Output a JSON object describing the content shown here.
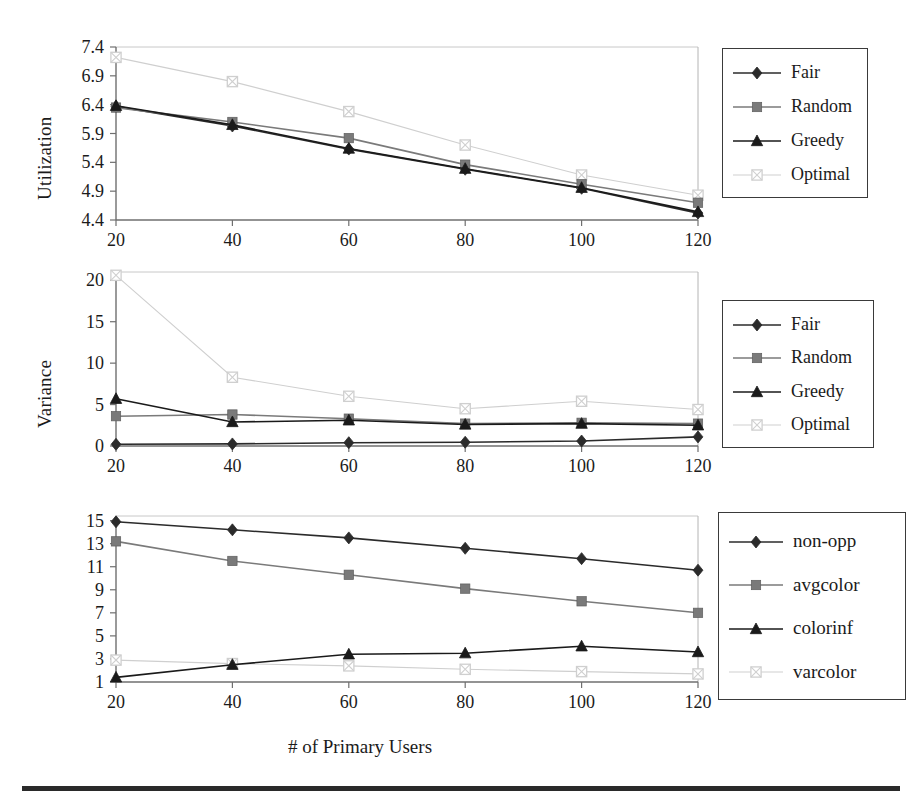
{
  "figure": {
    "xlabel": "# of Primary Users",
    "background": "#ffffff",
    "rule_color": "#2a2a2a"
  },
  "colors": {
    "fair": "#2b2b2b",
    "random": "#7a7a7a",
    "greedy": "#1a1a1a",
    "optimal": "#cfcfcf",
    "axis": "#9a9a9a",
    "text": "#1b1b1b"
  },
  "chart_data": [
    {
      "type": "line",
      "title": "",
      "xlabel": "# of Primary Users",
      "ylabel": "Utilization",
      "x": [
        20,
        40,
        60,
        80,
        100,
        120
      ],
      "xticks": [
        "20",
        "40",
        "60",
        "80",
        "100",
        "120"
      ],
      "xlim": [
        20,
        120
      ],
      "ylim": [
        4.4,
        7.4
      ],
      "yticks": [
        "4.4",
        "4.9",
        "5.4",
        "5.9",
        "6.4",
        "6.9",
        "7.4"
      ],
      "ytickvals": [
        4.4,
        4.9,
        5.4,
        5.9,
        6.4,
        6.9,
        7.4
      ],
      "grid": false,
      "legend_position": "right",
      "series": [
        {
          "name": "Fair",
          "marker": "diamond",
          "color": "#2b2b2b",
          "values": [
            6.37,
            6.03,
            5.63,
            5.28,
            4.95,
            4.52
          ]
        },
        {
          "name": "Random",
          "marker": "square",
          "color": "#7a7a7a",
          "values": [
            6.35,
            6.1,
            5.82,
            5.36,
            5.02,
            4.7
          ]
        },
        {
          "name": "Greedy",
          "marker": "triangle",
          "color": "#1a1a1a",
          "values": [
            6.38,
            6.05,
            5.64,
            5.29,
            4.96,
            4.54
          ]
        },
        {
          "name": "Optimal",
          "marker": "square-cross",
          "color": "#cfcfcf",
          "values": [
            7.22,
            6.8,
            6.28,
            5.7,
            5.18,
            4.83
          ]
        }
      ]
    },
    {
      "type": "line",
      "title": "",
      "xlabel": "# of Primary Users",
      "ylabel": "Variance",
      "x": [
        20,
        40,
        60,
        80,
        100,
        120
      ],
      "xticks": [
        "20",
        "40",
        "60",
        "80",
        "100",
        "120"
      ],
      "xlim": [
        20,
        120
      ],
      "ylim": [
        0,
        21
      ],
      "yticks": [
        "0",
        "5",
        "10",
        "15",
        "20"
      ],
      "ytickvals": [
        0,
        5,
        10,
        15,
        20
      ],
      "grid": false,
      "legend_position": "right",
      "series": [
        {
          "name": "Fair",
          "marker": "diamond",
          "color": "#2b2b2b",
          "values": [
            0.2,
            0.25,
            0.4,
            0.45,
            0.6,
            1.1
          ]
        },
        {
          "name": "Random",
          "marker": "square",
          "color": "#7a7a7a",
          "values": [
            3.6,
            3.8,
            3.3,
            2.7,
            2.8,
            2.7
          ]
        },
        {
          "name": "Greedy",
          "marker": "triangle",
          "color": "#1a1a1a",
          "values": [
            5.7,
            2.9,
            3.1,
            2.6,
            2.7,
            2.5
          ]
        },
        {
          "name": "Optimal",
          "marker": "square-cross",
          "color": "#cfcfcf",
          "values": [
            20.6,
            8.3,
            6.0,
            4.5,
            5.4,
            4.4
          ]
        }
      ]
    },
    {
      "type": "line",
      "title": "",
      "xlabel": "# of Primary Users",
      "ylabel": "",
      "x": [
        20,
        40,
        60,
        80,
        100,
        120
      ],
      "xticks": [
        "20",
        "40",
        "60",
        "80",
        "100",
        "120"
      ],
      "xlim": [
        20,
        120
      ],
      "ylim": [
        1,
        15.4
      ],
      "yticks": [
        "1",
        "3",
        "5",
        "7",
        "9",
        "11",
        "13",
        "15"
      ],
      "ytickvals": [
        1,
        3,
        5,
        7,
        9,
        11,
        13,
        15
      ],
      "grid": false,
      "legend_position": "right",
      "series": [
        {
          "name": "non-opp",
          "marker": "diamond",
          "color": "#2b2b2b",
          "values": [
            14.9,
            14.2,
            13.5,
            12.6,
            11.7,
            10.7
          ]
        },
        {
          "name": "avgcolor",
          "marker": "square",
          "color": "#7a7a7a",
          "values": [
            13.2,
            11.5,
            10.3,
            9.1,
            8.0,
            7.0
          ]
        },
        {
          "name": "colorinf",
          "marker": "triangle",
          "color": "#1a1a1a",
          "values": [
            1.4,
            2.5,
            3.4,
            3.5,
            4.1,
            3.6
          ]
        },
        {
          "name": "varcolor",
          "marker": "square-cross",
          "color": "#cfcfcf",
          "values": [
            2.9,
            2.6,
            2.4,
            2.1,
            1.9,
            1.7
          ]
        }
      ]
    }
  ],
  "legends": [
    {
      "id": "legend-1",
      "items": [
        {
          "label": "Fair",
          "marker": "diamond",
          "color": "#2b2b2b"
        },
        {
          "label": "Random",
          "marker": "square",
          "color": "#7a7a7a"
        },
        {
          "label": "Greedy",
          "marker": "triangle",
          "color": "#1a1a1a"
        },
        {
          "label": "Optimal",
          "marker": "square-cross",
          "color": "#cfcfcf"
        }
      ]
    },
    {
      "id": "legend-2",
      "items": [
        {
          "label": "Fair",
          "marker": "diamond",
          "color": "#2b2b2b"
        },
        {
          "label": "Random",
          "marker": "square",
          "color": "#7a7a7a"
        },
        {
          "label": "Greedy",
          "marker": "triangle",
          "color": "#1a1a1a"
        },
        {
          "label": "Optimal",
          "marker": "square-cross",
          "color": "#cfcfcf"
        }
      ]
    },
    {
      "id": "legend-3",
      "items": [
        {
          "label": "non-opp",
          "marker": "diamond",
          "color": "#2b2b2b"
        },
        {
          "label": "avgcolor",
          "marker": "square",
          "color": "#7a7a7a"
        },
        {
          "label": "colorinf",
          "marker": "triangle",
          "color": "#1a1a1a"
        },
        {
          "label": "varcolor",
          "marker": "square-cross",
          "color": "#cfcfcf"
        }
      ]
    }
  ]
}
